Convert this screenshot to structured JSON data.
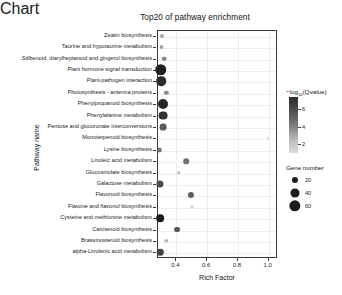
{
  "chart_data": {
    "type": "scatter",
    "title": "Top20 of pathway enrichment",
    "xlabel": "Rich Factor",
    "ylabel": "Pathway name",
    "xlim": [
      0.28,
      1.06
    ],
    "xticks": [
      "0.4",
      "0.6",
      "0.8",
      "1.0"
    ],
    "xtick_values": [
      0.4,
      0.6,
      0.8,
      1.0
    ],
    "grid": true,
    "legend_position": "right",
    "size_legend": {
      "title": "Gene number",
      "values": [
        20,
        40,
        60
      ]
    },
    "color_legend": {
      "title": "-log10(Qvalue)",
      "title_display": "−log",
      "title_sub": "10",
      "title_tail": "(Qvalue)",
      "ticks": [
        2,
        4,
        6
      ],
      "low_color": "#dddddd",
      "high_color": "#2b2b2b"
    },
    "categories": [
      "Zeatin biosynthesis",
      "Taurine and hypotaurine metabolism",
      "Stilbenoid, diarylheptanoid and gingerol biosynthesis",
      "Plant hormone signal transduction",
      "Plant-pathogen interaction",
      "Photosynthesis - antenna proteins",
      "Phenylpropanoid biosynthesis",
      "Phenylalanine metabolism",
      "Pentose and glucuronate interconversions",
      "Monoterpenoid biosynthesis",
      "Lysine biosynthesis",
      "Linoleic acid metabolism",
      "Glucosinolate biosynthesis",
      "Galactose metabolism",
      "Flavonoid biosynthesis",
      "Flavone and flavonol biosynthesis",
      "Cysteine and methionine metabolism",
      "Carotenoid biosynthesis",
      "Brassinosteroid biosynthesis",
      "alpha-Linolenic acid metabolism"
    ],
    "points": [
      {
        "pathway": "Zeatin biosynthesis",
        "rich_factor": 0.312,
        "gene_number": 10,
        "neg_log10_q": 3.1
      },
      {
        "pathway": "Taurine and hypotaurine metabolism",
        "rich_factor": 0.31,
        "gene_number": 9,
        "neg_log10_q": 3.4
      },
      {
        "pathway": "Stilbenoid, diarylheptanoid and gingerol biosynthesis",
        "rich_factor": 0.328,
        "gene_number": 12,
        "neg_log10_q": 4.0
      },
      {
        "pathway": "Plant hormone signal transduction",
        "rich_factor": 0.305,
        "gene_number": 62,
        "neg_log10_q": 6.8
      },
      {
        "pathway": "Plant-pathogen interaction",
        "rich_factor": 0.308,
        "gene_number": 44,
        "neg_log10_q": 6.5
      },
      {
        "pathway": "Photosynthesis - antenna proteins",
        "rich_factor": 0.34,
        "gene_number": 11,
        "neg_log10_q": 3.8
      },
      {
        "pathway": "Phenylpropanoid biosynthesis",
        "rich_factor": 0.318,
        "gene_number": 48,
        "neg_log10_q": 6.6
      },
      {
        "pathway": "Phenylalanine metabolism",
        "rich_factor": 0.317,
        "gene_number": 38,
        "neg_log10_q": 6.3
      },
      {
        "pathway": "Pentose and glucuronate interconversions",
        "rich_factor": 0.322,
        "gene_number": 24,
        "neg_log10_q": 5.2
      },
      {
        "pathway": "Monoterpenoid biosynthesis",
        "rich_factor": 1.0,
        "gene_number": 4,
        "neg_log10_q": 1.6
      },
      {
        "pathway": "Lysine biosynthesis",
        "rich_factor": 0.297,
        "gene_number": 13,
        "neg_log10_q": 4.4
      },
      {
        "pathway": "Linoleic acid metabolism",
        "rich_factor": 0.47,
        "gene_number": 17,
        "neg_log10_q": 4.6
      },
      {
        "pathway": "Glucosinolate biosynthesis",
        "rich_factor": 0.422,
        "gene_number": 8,
        "neg_log10_q": 2.6
      },
      {
        "pathway": "Galactose metabolism",
        "rich_factor": 0.298,
        "gene_number": 26,
        "neg_log10_q": 5.6
      },
      {
        "pathway": "Flavonoid biosynthesis",
        "rich_factor": 0.5,
        "gene_number": 20,
        "neg_log10_q": 5.0
      },
      {
        "pathway": "Flavone and flavonol biosynthesis",
        "rich_factor": 0.505,
        "gene_number": 6,
        "neg_log10_q": 2.1
      },
      {
        "pathway": "Cysteine and methionine metabolism",
        "rich_factor": 0.3,
        "gene_number": 30,
        "neg_log10_q": 6.9
      },
      {
        "pathway": "Carotenoid biosynthesis",
        "rich_factor": 0.41,
        "gene_number": 18,
        "neg_log10_q": 5.3
      },
      {
        "pathway": "Brassinosteroid biosynthesis",
        "rich_factor": 0.34,
        "gene_number": 7,
        "neg_log10_q": 2.8
      },
      {
        "pathway": "alpha-Linolenic acid metabolism",
        "rich_factor": 0.3,
        "gene_number": 22,
        "neg_log10_q": 5.8
      }
    ]
  }
}
